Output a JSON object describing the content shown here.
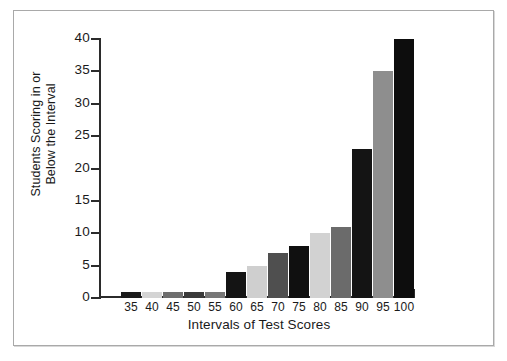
{
  "chart_data": {
    "type": "bar",
    "title": "",
    "subtitle": "",
    "xlabel": "Intervals of Test Scores",
    "ylabel": "Students Scoring in or\nBelow the Interval",
    "categories": [
      "35",
      "40",
      "45",
      "50",
      "55",
      "60",
      "65",
      "70",
      "75",
      "80",
      "85",
      "90",
      "95",
      "100"
    ],
    "values": [
      1,
      1,
      1,
      1,
      1,
      4,
      5,
      7,
      8,
      10,
      11,
      23,
      35,
      40
    ],
    "bar_colors": [
      "#1a1a1a",
      "#d4d4d4",
      "#6e6e6e",
      "#3a3a3a",
      "#777777",
      "#141414",
      "#cfcfcf",
      "#4f4f4f",
      "#101010",
      "#d2d2d2",
      "#6b6b6b",
      "#141414",
      "#8e8e8e",
      "#0d0d0d"
    ],
    "ylim": [
      0,
      40
    ],
    "ytick_values": [
      0,
      5,
      10,
      15,
      20,
      25,
      30,
      35,
      40
    ],
    "ytick_labels": [
      "0",
      "5",
      "10",
      "15",
      "20",
      "25",
      "30",
      "35",
      "40"
    ],
    "xtick_labels": [
      "35",
      "40",
      "45",
      "50",
      "55",
      "60",
      "65",
      "70",
      "75",
      "80",
      "85",
      "90",
      "95",
      "100"
    ],
    "grid": false,
    "legend": null,
    "annotations": []
  },
  "figure": {
    "frame_border_color": "#a9a9a9",
    "background_color": "#ffffff",
    "axis_color": "#2b2b2b",
    "text_color": "#1a1a1a"
  }
}
